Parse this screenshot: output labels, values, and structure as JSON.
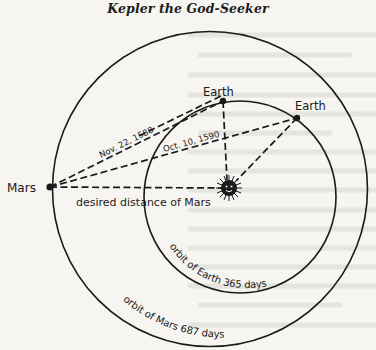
{
  "page": {
    "title": "Kepler the God-Seeker",
    "background_color": "#f6f5f1",
    "ink_color": "#1a1a1a"
  },
  "diagram": {
    "bodies": {
      "mars": {
        "label": "Mars"
      },
      "earth_1": {
        "label": "Earth"
      },
      "earth_2": {
        "label": "Earth"
      },
      "sun": {
        "label": ""
      }
    },
    "sightlines": {
      "first": {
        "label": "Nov. 22, 1588"
      },
      "second": {
        "label": "Oct. 10, 1590"
      },
      "desired": {
        "label": "desired distance of Mars"
      }
    },
    "orbits": {
      "earth": {
        "label": "orbit of Earth  365 days"
      },
      "mars": {
        "label": "orbit of Mars  687 days"
      }
    }
  }
}
